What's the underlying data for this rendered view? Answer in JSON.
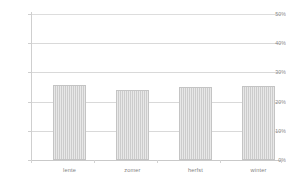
{
  "chart_data": {
    "type": "bar",
    "title": "",
    "subtitle": "",
    "xlabel": "",
    "ylabel": "",
    "categories": [
      "lente",
      "zomer",
      "herfst",
      "winter"
    ],
    "values": [
      25.7,
      24.1,
      25.0,
      25.5
    ],
    "value_unit": "%",
    "ylim": [
      0,
      50
    ],
    "yticks": [
      0,
      10,
      20,
      30,
      40,
      50
    ],
    "ytick_labels": [
      "0%",
      "10%",
      "20%",
      "30%",
      "40%",
      "50%"
    ],
    "grid": true,
    "grid_axis": "y",
    "legend": false,
    "legend_position": "none",
    "series": [
      {
        "name": "",
        "values": [
          25.7,
          24.1,
          25.0,
          25.5
        ]
      }
    ],
    "colors": {
      "bar_fill": "#cccccc",
      "bar_stroke": "#c4c4c4",
      "gridline": "#d9d9d9",
      "axis": "#c9c9c9",
      "tick_text": "#8a8a8a",
      "category_text": "#7f7f7f",
      "background": "#ffffff"
    }
  }
}
